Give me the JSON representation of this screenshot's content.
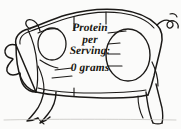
{
  "image": {
    "kind": "butcher-cut-chart",
    "subject": "pig",
    "background_color": "#fbfbfa",
    "ink_color": "#1b1917",
    "orientation": "facing-left",
    "width": 181,
    "height": 129
  },
  "overlay": {
    "lines": [
      "Protein",
      "per",
      "Serving:",
      "0 grams"
    ],
    "line1": "Protein",
    "line2": "per",
    "line3": "Serving:",
    "line4": "0 grams",
    "text_color": "#17150f",
    "style": "italic-serif-bold"
  },
  "diagram": {
    "parts": [
      "head",
      "ear",
      "snout",
      "jowl",
      "shoulder",
      "loin",
      "belly",
      "ham",
      "front-leg",
      "hind-leg",
      "trotter",
      "curly-tail"
    ]
  }
}
